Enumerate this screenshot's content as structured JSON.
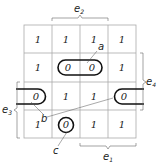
{
  "diagram": {
    "type": "karnaugh-map",
    "rows": [
      [
        "1",
        "1",
        "1",
        "1"
      ],
      [
        "1",
        "0",
        "0",
        "1"
      ],
      [
        "0",
        "1",
        "1",
        "0"
      ],
      [
        "1",
        "0",
        "1",
        "1"
      ]
    ],
    "groups": {
      "a": {
        "label": "a",
        "cells": [
          [
            1,
            1
          ],
          [
            1,
            2
          ]
        ]
      },
      "b": {
        "label": "b",
        "cells": [
          [
            2,
            0
          ],
          [
            2,
            3
          ]
        ]
      },
      "c": {
        "label": "c",
        "cells": [
          [
            3,
            1
          ]
        ]
      }
    },
    "braces": {
      "e1": {
        "letter": "e",
        "sub": "1"
      },
      "e2": {
        "letter": "e",
        "sub": "2"
      },
      "e3": {
        "letter": "e",
        "sub": "3"
      },
      "e4": {
        "letter": "e",
        "sub": "4"
      }
    },
    "colors": {
      "grid": "#999999",
      "loop": "#111111",
      "text": "#222222"
    }
  }
}
